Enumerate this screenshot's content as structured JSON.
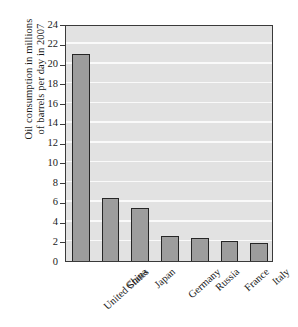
{
  "chart_data": {
    "type": "bar",
    "title": "",
    "subtitle": "",
    "xlabel": "",
    "ylabel": "Oil consumption in millions of barrels per day in 2007",
    "ylabel_lines": [
      "Oil consumption in millions",
      "of barrels per day in 2007"
    ],
    "categories": [
      "United States",
      "China",
      "Japan",
      "Germany",
      "Russia",
      "France",
      "Italy"
    ],
    "values": [
      21.0,
      6.4,
      5.4,
      2.5,
      2.3,
      2.0,
      1.8
    ],
    "ylim": [
      0,
      24
    ],
    "ytick_step": 2,
    "yticks": [
      0,
      2,
      4,
      6,
      8,
      10,
      12,
      14,
      16,
      18,
      20,
      22,
      24
    ],
    "ytick_labels": [
      "0",
      "2",
      "4",
      "6",
      "8",
      "10",
      "12",
      "14",
      "16",
      "18",
      "20",
      "22",
      "24"
    ],
    "grid": "horizontal",
    "legend": "none",
    "legend_position": "none",
    "annotations": [],
    "series": [
      {
        "name": "Oil consumption",
        "values": [
          21.0,
          6.4,
          5.4,
          2.5,
          2.3,
          2.0,
          1.8
        ]
      }
    ]
  },
  "style": {
    "plot_background": "#e2e2e2",
    "gridline_color": "#fafafa",
    "bar_fill": "#9d9d9d",
    "bar_border": "#262626",
    "axis_color": "#3a3a3a",
    "text_color": "#1a1a1a",
    "page_background": "#ffffff"
  }
}
